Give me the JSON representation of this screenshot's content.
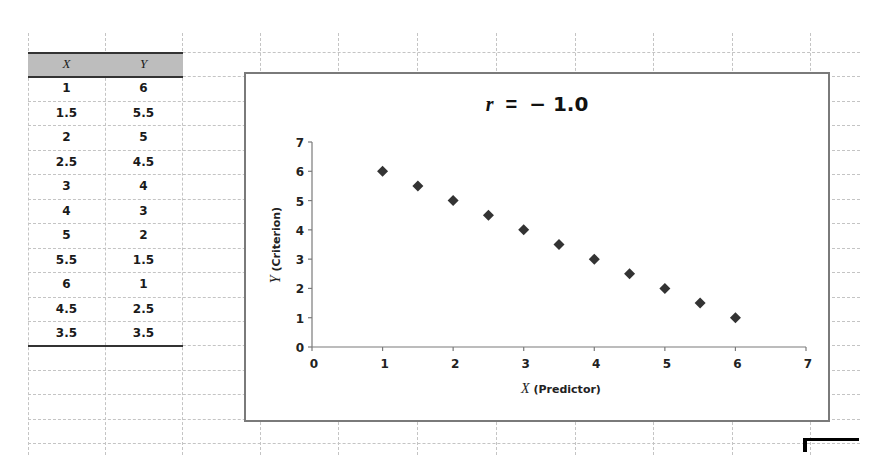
{
  "table": {
    "headers": [
      "X",
      "Y"
    ],
    "rows": [
      [
        "1",
        "6"
      ],
      [
        "1.5",
        "5.5"
      ],
      [
        "2",
        "5"
      ],
      [
        "2.5",
        "4.5"
      ],
      [
        "3",
        "4"
      ],
      [
        "4",
        "3"
      ],
      [
        "5",
        "2"
      ],
      [
        "5.5",
        "1.5"
      ],
      [
        "6",
        "1"
      ],
      [
        "4.5",
        "2.5"
      ],
      [
        "3.5",
        "3.5"
      ]
    ],
    "header_bg": "#bdbdbd"
  },
  "chart": {
    "title_var": "r",
    "title_eq": "=",
    "title_value": "− 1.0",
    "xlabel_var": "X",
    "xlabel_text": "(Predictor)",
    "ylabel_var": "Y",
    "ylabel_text": "(Criterion)",
    "marker_color": "#333333"
  },
  "chart_data": {
    "type": "scatter",
    "xlabel": "X (Predictor)",
    "ylabel": "Y (Criterion)",
    "x": [
      1,
      1.5,
      2,
      2.5,
      3,
      3.5,
      4,
      4.5,
      5,
      5.5,
      6
    ],
    "y": [
      6,
      5.5,
      5,
      4.5,
      4,
      3.5,
      3,
      2.5,
      2,
      1.5,
      1
    ],
    "xlim": [
      0,
      7
    ],
    "ylim": [
      0,
      7
    ],
    "xticks": [
      "0",
      "1",
      "2",
      "3",
      "4",
      "5",
      "6",
      "7"
    ],
    "yticks": [
      "0",
      "1",
      "2",
      "3",
      "4",
      "5",
      "6",
      "7"
    ],
    "grid": false,
    "legend": null,
    "marker": "diamond"
  }
}
